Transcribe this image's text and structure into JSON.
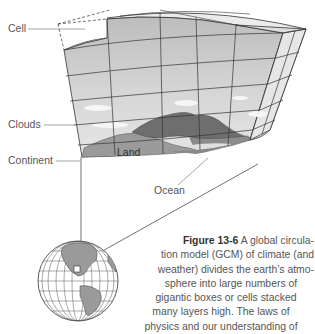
{
  "labels": {
    "cell": "Cell",
    "clouds": "Clouds",
    "continent": "Continent",
    "land": "Land",
    "ocean": "Ocean"
  },
  "caption": {
    "figure_number": "Figure 13-6",
    "lines": [
      "A global circula-",
      "tion model (GCM) of climate (and",
      "weather) divides the earth’s atmo-",
      "sphere into large numbers of",
      "gigantic boxes or cells stacked",
      "many layers high. The laws of",
      "physics and our understanding of"
    ]
  },
  "colors": {
    "grid_front": "#c8c8c8",
    "grid_side": "#e2e2e2",
    "grid_top": "#ececec",
    "land_dark": "#6e6e6e",
    "land_mid": "#8a8a8a",
    "ocean": "#a8a8a8",
    "line": "#333333"
  }
}
